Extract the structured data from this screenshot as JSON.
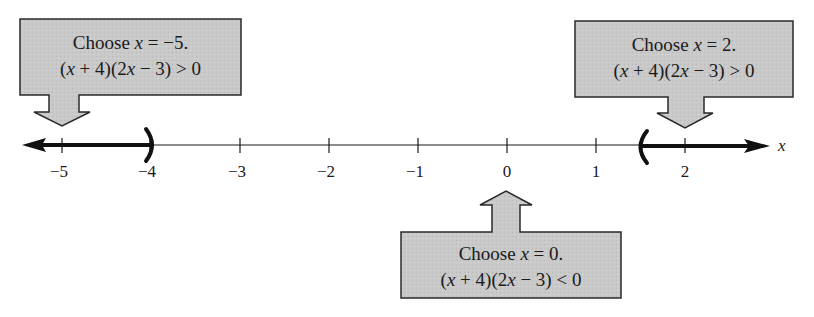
{
  "figure": {
    "axis": {
      "variable": "x",
      "ticks": [
        {
          "value": -5,
          "label": "−5"
        },
        {
          "value": -4,
          "label": "−4"
        },
        {
          "value": -3,
          "label": "−3"
        },
        {
          "value": -2,
          "label": "−2"
        },
        {
          "value": -1,
          "label": "−1"
        },
        {
          "value": 0,
          "label": "0"
        },
        {
          "value": 1,
          "label": "1"
        },
        {
          "value": 2,
          "label": "2"
        }
      ]
    },
    "solution_intervals": [
      {
        "from": "-infinity",
        "to": -4,
        "open_endpoint": "parenthesis at -4"
      },
      {
        "from": 1.5,
        "to": "infinity",
        "open_endpoint": "parenthesis at 3/2"
      }
    ],
    "callouts": {
      "left": {
        "line1_prefix": "Choose ",
        "line1_var": "x",
        "line1_suffix": " = −5.",
        "line2_a": "(",
        "line2_x1": "x",
        "line2_b": " + 4)(2",
        "line2_x2": "x",
        "line2_c": " − 3) > 0",
        "arrow": "down"
      },
      "right": {
        "line1_prefix": "Choose ",
        "line1_var": "x",
        "line1_suffix": " = 2.",
        "line2_a": "(",
        "line2_x1": "x",
        "line2_b": " + 4)(2",
        "line2_x2": "x",
        "line2_c": " − 3) > 0",
        "arrow": "down"
      },
      "bottom": {
        "line1_prefix": "Choose ",
        "line1_var": "x",
        "line1_suffix": " = 0.",
        "line2_a": "(",
        "line2_x1": "x",
        "line2_b": " + 4)(2",
        "line2_x2": "x",
        "line2_c": " − 3) < 0",
        "arrow": "up"
      }
    },
    "colors": {
      "box_fill": "#c8c8c8",
      "box_border": "#2a2a2a",
      "line": "#1a1a1a"
    }
  }
}
